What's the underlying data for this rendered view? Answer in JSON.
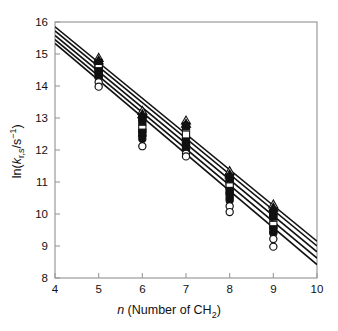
{
  "chart_data": {
    "type": "scatter",
    "title": "",
    "xlabel": "n (Number of CH2)",
    "xlabel_parts": {
      "italic": "n",
      "rest": " (Number of CH",
      "sub": "2",
      "close": ")"
    },
    "ylabel": "ln(kr,s/s-1)",
    "ylabel_parts": {
      "lead": "ln(",
      "italic_k": "k",
      "sub_rs": "r,s",
      "slash": "/s",
      "sup": "−1",
      "close": ")"
    },
    "xlim": [
      4,
      10
    ],
    "ylim": [
      8,
      16
    ],
    "xticks": [
      4,
      5,
      6,
      7,
      8,
      9,
      10
    ],
    "xticklabels": [
      "4",
      "5",
      "6",
      "7",
      "8",
      "9",
      "10"
    ],
    "yticks": [
      8,
      9,
      10,
      11,
      12,
      13,
      14,
      15,
      16
    ],
    "yticklabels": [
      "8",
      "9",
      "10",
      "11",
      "12",
      "13",
      "14",
      "15",
      "16"
    ],
    "grid": false,
    "legend": "none",
    "frame_color": "#9a9a9a",
    "line_color": "#111111",
    "marker_color": "#111111",
    "series": [
      {
        "name": "line-1",
        "type": "line",
        "intercept_at_x4": 15.85,
        "value_at_x10": 9.15,
        "slope": -1.1167,
        "x": [
          4,
          10
        ],
        "y": [
          15.85,
          9.15
        ]
      },
      {
        "name": "line-2",
        "type": "line",
        "intercept_at_x4": 15.72,
        "value_at_x10": 9.0,
        "slope": -1.12,
        "x": [
          4,
          10
        ],
        "y": [
          15.72,
          9.0
        ]
      },
      {
        "name": "line-3",
        "type": "line",
        "intercept_at_x4": 15.58,
        "value_at_x10": 8.82,
        "slope": -1.1267,
        "x": [
          4,
          10
        ],
        "y": [
          15.58,
          8.82
        ]
      },
      {
        "name": "line-4",
        "type": "line",
        "intercept_at_x4": 15.45,
        "value_at_x10": 8.62,
        "slope": -1.1383,
        "x": [
          4,
          10
        ],
        "y": [
          15.45,
          8.62
        ]
      },
      {
        "name": "line-5",
        "type": "line",
        "intercept_at_x4": 15.33,
        "value_at_x10": 8.42,
        "slope": -1.1517,
        "x": [
          4,
          10
        ],
        "y": [
          15.33,
          8.42
        ]
      }
    ],
    "points": [
      {
        "x": 5,
        "y": 14.88,
        "marker": "triangle-open"
      },
      {
        "x": 5,
        "y": 14.8,
        "marker": "triangle-filled"
      },
      {
        "x": 5,
        "y": 14.72,
        "marker": "square-filled"
      },
      {
        "x": 5,
        "y": 14.64,
        "marker": "square-filled"
      },
      {
        "x": 5,
        "y": 14.56,
        "marker": "square-open"
      },
      {
        "x": 5,
        "y": 14.46,
        "marker": "square-filled"
      },
      {
        "x": 5,
        "y": 14.36,
        "marker": "square-filled"
      },
      {
        "x": 5,
        "y": 14.26,
        "marker": "circle-filled"
      },
      {
        "x": 5,
        "y": 14.12,
        "marker": "circle-open"
      },
      {
        "x": 5,
        "y": 13.98,
        "marker": "circle-open"
      },
      {
        "x": 6,
        "y": 13.22,
        "marker": "triangle-open"
      },
      {
        "x": 6,
        "y": 13.12,
        "marker": "triangle-filled"
      },
      {
        "x": 6,
        "y": 13.02,
        "marker": "square-filled"
      },
      {
        "x": 6,
        "y": 12.9,
        "marker": "square-filled"
      },
      {
        "x": 6,
        "y": 12.66,
        "marker": "square-open"
      },
      {
        "x": 6,
        "y": 12.54,
        "marker": "square-filled"
      },
      {
        "x": 6,
        "y": 12.44,
        "marker": "circle-filled"
      },
      {
        "x": 6,
        "y": 12.34,
        "marker": "circle-filled"
      },
      {
        "x": 6,
        "y": 12.12,
        "marker": "circle-open"
      },
      {
        "x": 7,
        "y": 12.92,
        "marker": "triangle-open"
      },
      {
        "x": 7,
        "y": 12.82,
        "marker": "triangle-filled"
      },
      {
        "x": 7,
        "y": 12.74,
        "marker": "square-filled"
      },
      {
        "x": 7,
        "y": 12.48,
        "marker": "square-open"
      },
      {
        "x": 7,
        "y": 12.26,
        "marker": "square-filled"
      },
      {
        "x": 7,
        "y": 12.12,
        "marker": "square-filled"
      },
      {
        "x": 7,
        "y": 12.02,
        "marker": "circle-filled"
      },
      {
        "x": 7,
        "y": 11.88,
        "marker": "circle-open"
      },
      {
        "x": 7,
        "y": 11.8,
        "marker": "circle-open"
      },
      {
        "x": 8,
        "y": 11.34,
        "marker": "triangle-open"
      },
      {
        "x": 8,
        "y": 11.24,
        "marker": "triangle-filled"
      },
      {
        "x": 8,
        "y": 11.14,
        "marker": "square-filled"
      },
      {
        "x": 8,
        "y": 11.02,
        "marker": "square-filled"
      },
      {
        "x": 8,
        "y": 10.86,
        "marker": "square-open"
      },
      {
        "x": 8,
        "y": 10.72,
        "marker": "square-filled"
      },
      {
        "x": 8,
        "y": 10.58,
        "marker": "square-filled"
      },
      {
        "x": 8,
        "y": 10.42,
        "marker": "circle-filled"
      },
      {
        "x": 8,
        "y": 10.24,
        "marker": "circle-open"
      },
      {
        "x": 8,
        "y": 10.06,
        "marker": "circle-open"
      },
      {
        "x": 9,
        "y": 10.3,
        "marker": "triangle-open"
      },
      {
        "x": 9,
        "y": 10.2,
        "marker": "triangle-filled"
      },
      {
        "x": 9,
        "y": 10.02,
        "marker": "square-filled"
      },
      {
        "x": 9,
        "y": 9.92,
        "marker": "square-filled"
      },
      {
        "x": 9,
        "y": 9.66,
        "marker": "square-open"
      },
      {
        "x": 9,
        "y": 9.52,
        "marker": "square-filled"
      },
      {
        "x": 9,
        "y": 9.4,
        "marker": "circle-filled"
      },
      {
        "x": 9,
        "y": 9.22,
        "marker": "circle-open"
      },
      {
        "x": 9,
        "y": 8.98,
        "marker": "circle-open"
      }
    ]
  },
  "plot": {
    "pixel_box": {
      "left": 55,
      "top": 22,
      "right": 317,
      "bottom": 278
    }
  }
}
